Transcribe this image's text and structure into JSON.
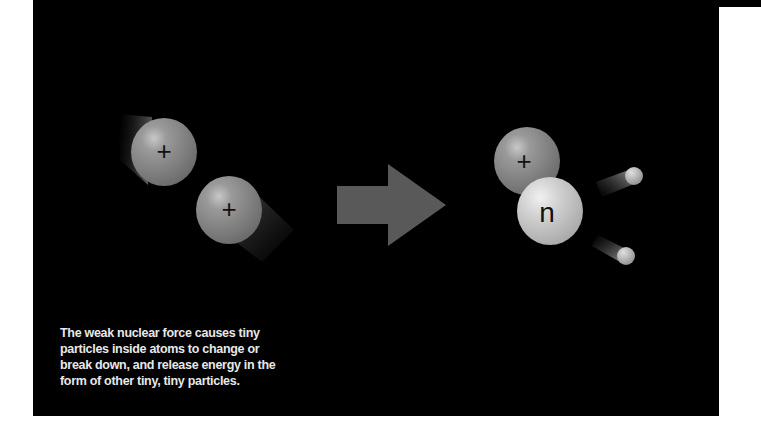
{
  "diagram": {
    "before": {
      "particles": [
        {
          "label": "+",
          "type": "proton"
        },
        {
          "label": "+",
          "type": "proton"
        }
      ]
    },
    "arrow": {
      "direction": "right",
      "color": "#595959"
    },
    "after": {
      "particles": [
        {
          "label": "+",
          "type": "proton"
        },
        {
          "label": "n",
          "type": "neutron"
        },
        {
          "label": "",
          "type": "emitted-particle"
        },
        {
          "label": "",
          "type": "emitted-particle"
        }
      ]
    },
    "caption": {
      "lines": [
        "The weak nuclear force causes tiny",
        "particles inside atoms to change or",
        "break down, and release energy in the",
        "form of other tiny, tiny particles."
      ]
    },
    "colors": {
      "background": "#000000",
      "proton": "#8a8a8a",
      "neutron": "#cfcfcf",
      "text": "#e8e8e8"
    }
  }
}
